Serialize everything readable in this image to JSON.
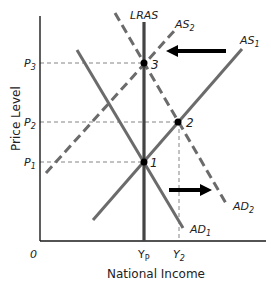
{
  "diagram": {
    "title_cut_off": "",
    "axes": {
      "y_label": "Price Level",
      "x_label": "National Income",
      "origin": "0"
    },
    "price_levels": [
      {
        "label": "P",
        "sub": "3",
        "y": 63
      },
      {
        "label": "P",
        "sub": "2",
        "y": 122
      },
      {
        "label": "P",
        "sub": "1",
        "y": 162
      }
    ],
    "income_levels": [
      {
        "label": "Y",
        "sub": "P",
        "x": 144
      },
      {
        "label": "Y",
        "sub": "2",
        "x": 179
      }
    ],
    "curves": [
      {
        "name": "LRAS",
        "label": "LRAS",
        "style": "solid"
      },
      {
        "name": "AS1",
        "label": "AS",
        "sub": "1",
        "style": "solid"
      },
      {
        "name": "AS2",
        "label": "AS",
        "sub": "2",
        "style": "dashed"
      },
      {
        "name": "AD1",
        "label": "AD",
        "sub": "1",
        "style": "solid"
      },
      {
        "name": "AD2",
        "label": "AD",
        "sub": "2",
        "style": "dashed"
      }
    ],
    "points": [
      {
        "label": "1",
        "x": 144,
        "y": 162
      },
      {
        "label": "2",
        "x": 178,
        "y": 122
      },
      {
        "label": "3",
        "x": 144,
        "y": 63
      }
    ],
    "arrows": [
      {
        "name": "AS-shift-left",
        "direction": "left"
      },
      {
        "name": "AD-shift-right",
        "direction": "right"
      }
    ],
    "colors": {
      "curve": "#6b6b6b",
      "axis": "#1a1a1a",
      "arrow": "#000000",
      "guide": "#777777"
    }
  },
  "labels": {
    "lras": "LRAS",
    "as": "AS",
    "ad": "AD",
    "sub1": "1",
    "sub2": "2",
    "p": "P",
    "y": "Y",
    "subP": "P",
    "pt1": "1",
    "pt2": "2",
    "pt3": "3",
    "origin": "0",
    "ylabel": "Price Level",
    "xlabel": "National Income"
  }
}
